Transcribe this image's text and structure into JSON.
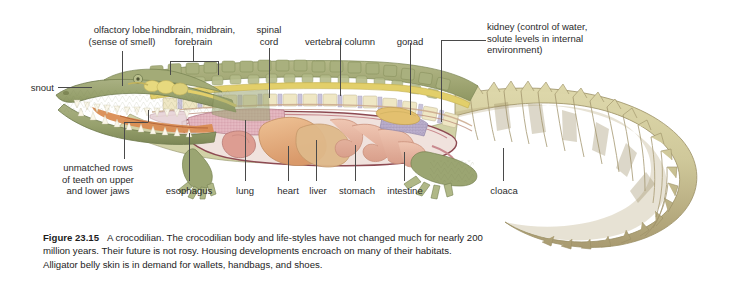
{
  "figure": {
    "number": "Figure 23.15",
    "caption_text": "A crocodilian. The crocodilian body and life-styles have not changed much for nearly 200 million years. Their future is not rosy. Housing developments encroach on many of their habitats. Alligator belly skin is in demand for wallets, handbags, and shoes.",
    "background_color": "#ffffff",
    "text_color": "#2b2b2b",
    "leader_color": "#4a4a4a"
  },
  "labels": {
    "top": [
      {
        "id": "olfactory-lobe",
        "text": "olfactory lobe\n(sense of smell)",
        "align": "center"
      },
      {
        "id": "brain-regions",
        "text": "hindbrain, midbrain,\nforebrain",
        "align": "center"
      },
      {
        "id": "spinal-cord",
        "text": "spinal\ncord",
        "align": "center"
      },
      {
        "id": "vertebral-column",
        "text": "vertebral column",
        "align": "center"
      },
      {
        "id": "gonad",
        "text": "gonad",
        "align": "center"
      },
      {
        "id": "kidney",
        "text": "kidney (control of water,\nsolute levels in internal\nenvironment)",
        "align": "left"
      }
    ],
    "left": [
      {
        "id": "snout",
        "text": "snout",
        "align": "right"
      }
    ],
    "bottom": [
      {
        "id": "teeth",
        "text": "unmatched rows\nof teeth on upper\nand lower jaws",
        "align": "center"
      },
      {
        "id": "esophagus",
        "text": "esophagus",
        "align": "center"
      },
      {
        "id": "lung",
        "text": "lung",
        "align": "center"
      },
      {
        "id": "heart",
        "text": "heart",
        "align": "center"
      },
      {
        "id": "liver",
        "text": "liver",
        "align": "center"
      },
      {
        "id": "stomach",
        "text": "stomach",
        "align": "center"
      },
      {
        "id": "intestine",
        "text": "intestine",
        "align": "center"
      },
      {
        "id": "cloaca",
        "text": "cloaca",
        "align": "center"
      }
    ]
  },
  "anatomy_colors": {
    "skin_dorsal": "#9aa06a",
    "skin_head": "#9ba572",
    "skin_tail": "#cfc89a",
    "tail_shadow": "#9e9068",
    "vertebra": "#efe7c4",
    "disc": "#c9c3da",
    "spinal_cord": "#e2cf6a",
    "brain": "#e7d97e",
    "lung": "#e2b3bd",
    "heart": "#dd9d92",
    "liver": "#e0a878",
    "stomach": "#dfb98a",
    "intestine": "#e6b49e",
    "kidney": "#b9aecb",
    "gonad": "#e3c06f",
    "mouth": "#d98a4e",
    "teeth": "#fbf7ea",
    "body_outline": "#8d4a52",
    "cavity_wall": "#c98a8f"
  }
}
